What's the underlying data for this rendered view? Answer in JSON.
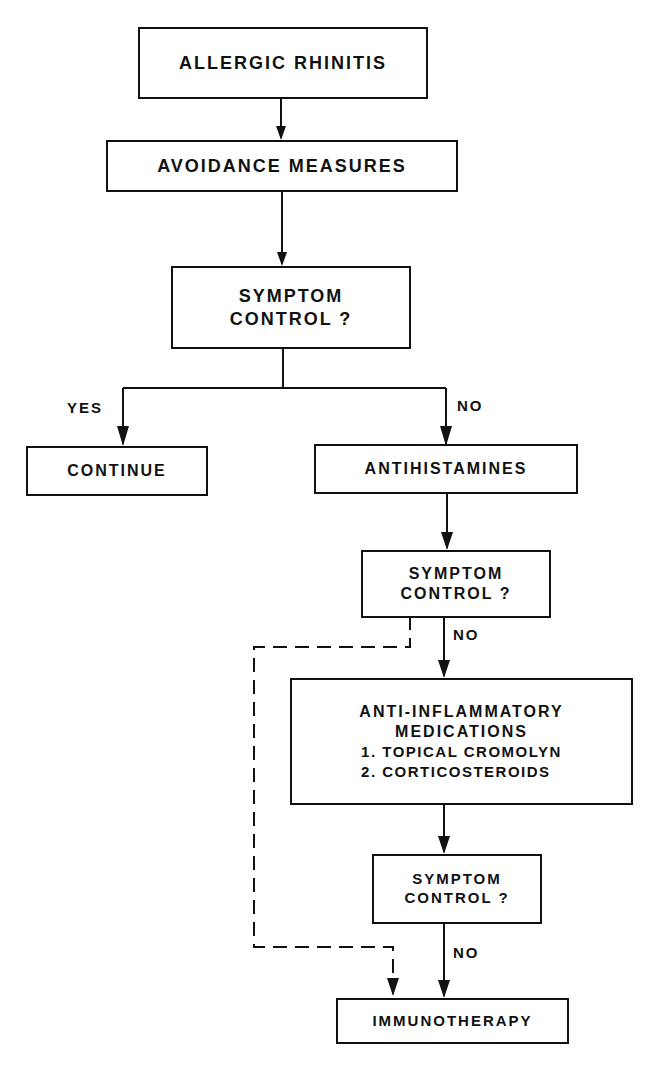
{
  "diagram": {
    "type": "flowchart",
    "nodes": {
      "start": {
        "label": "ALLERGIC RHINITIS"
      },
      "avoidance": {
        "label": "AVOIDANCE MEASURES"
      },
      "check1": {
        "line1": "SYMPTOM",
        "line2": "CONTROL ?"
      },
      "continue": {
        "label": "CONTINUE"
      },
      "antihistamines": {
        "label": "ANTIHISTAMINES"
      },
      "check2": {
        "line1": "SYMPTOM",
        "line2": "CONTROL ?"
      },
      "antiinflammatory": {
        "line1": "ANTI-INFLAMMATORY",
        "line2": "MEDICATIONS",
        "items": [
          "1.  TOPICAL CROMOLYN",
          "2.  CORTICOSTEROIDS"
        ]
      },
      "check3": {
        "line1": "SYMPTOM",
        "line2": "CONTROL ?"
      },
      "immunotherapy": {
        "label": "IMMUNOTHERAPY"
      }
    },
    "edge_labels": {
      "yes": "YES",
      "no1": "NO",
      "no2": "NO",
      "no3": "NO"
    },
    "edges": [
      {
        "from": "start",
        "to": "avoidance",
        "style": "solid"
      },
      {
        "from": "avoidance",
        "to": "check1",
        "style": "solid"
      },
      {
        "from": "check1",
        "to": "continue",
        "label": "YES",
        "style": "solid"
      },
      {
        "from": "check1",
        "to": "antihistamines",
        "label": "NO",
        "style": "solid"
      },
      {
        "from": "antihistamines",
        "to": "check2",
        "style": "solid"
      },
      {
        "from": "check2",
        "to": "antiinflammatory",
        "label": "NO",
        "style": "solid"
      },
      {
        "from": "check2",
        "to": "immunotherapy",
        "style": "dashed"
      },
      {
        "from": "antiinflammatory",
        "to": "check3",
        "style": "solid"
      },
      {
        "from": "check3",
        "to": "immunotherapy",
        "label": "NO",
        "style": "solid"
      }
    ]
  }
}
